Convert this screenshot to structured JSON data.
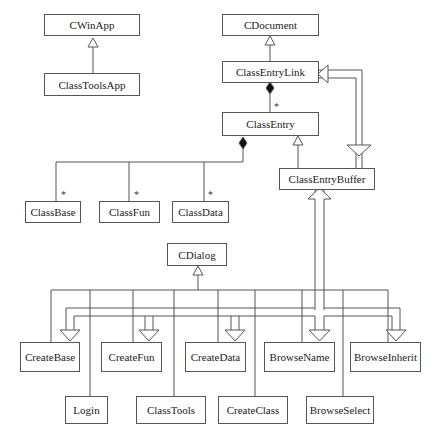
{
  "diagram": {
    "type": "UML class diagram",
    "classes": {
      "cwinapp": "CWinApp",
      "classtoolsapp": "ClassToolsApp",
      "cdocument": "CDocument",
      "classentrylink": "ClassEntryLink",
      "classentry": "ClassEntry",
      "classentrybuffer": "ClassEntryBuffer",
      "classbase": "ClassBase",
      "classfun": "ClassFun",
      "classdata": "ClassData",
      "cdialog": "CDialog",
      "createbase": "CreateBase",
      "createfun": "CreateFun",
      "createdata": "CreateData",
      "browsename": "BrowseName",
      "browseinherit": "BrowseInherit",
      "login": "Login",
      "classtools": "ClassTools",
      "createclass": "CreateClass",
      "browseselect": "BrowseSelect"
    },
    "multiplicity": {
      "link_to_entry": "*",
      "entry_to_base": "*",
      "entry_to_fun": "*",
      "entry_to_data": "*"
    },
    "relationships": [
      {
        "from": "ClassToolsApp",
        "to": "CWinApp",
        "kind": "generalization"
      },
      {
        "from": "ClassEntryLink",
        "to": "CDocument",
        "kind": "generalization"
      },
      {
        "from": "ClassEntryLink",
        "to": "ClassEntry",
        "kind": "composition",
        "multiplicity": "*"
      },
      {
        "from": "ClassEntryBuffer",
        "to": "ClassEntry",
        "kind": "generalization"
      },
      {
        "from": "ClassEntryBuffer",
        "to": "ClassEntryLink",
        "kind": "dependency-hollow"
      },
      {
        "from": "ClassEntry",
        "to": "ClassBase",
        "kind": "composition",
        "multiplicity": "*"
      },
      {
        "from": "ClassEntry",
        "to": "ClassFun",
        "kind": "composition",
        "multiplicity": "*"
      },
      {
        "from": "ClassEntry",
        "to": "ClassData",
        "kind": "composition",
        "multiplicity": "*"
      },
      {
        "from": "Dialogs",
        "to": "CDialog",
        "kind": "generalization"
      },
      {
        "from": "ClassEntryBuffer",
        "to": "CreateBase/CreateFun/CreateData/BrowseName/BrowseInherit",
        "kind": "dependency-hollow"
      }
    ]
  }
}
